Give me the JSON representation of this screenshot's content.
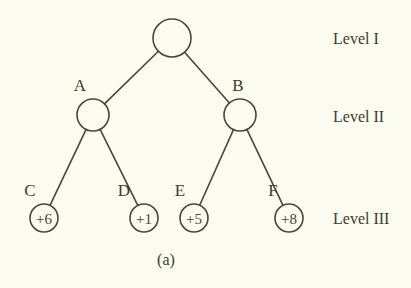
{
  "figure": {
    "caption": "(a)",
    "background_color": "#fcfbef",
    "ink_color": "#4c4639"
  },
  "levels": [
    {
      "id": "level-1",
      "label": "Level I",
      "x": 333,
      "y": 38
    },
    {
      "id": "level-2",
      "label": "Level II",
      "x": 333,
      "y": 116
    },
    {
      "id": "level-3",
      "label": "Level III",
      "x": 333,
      "y": 218
    }
  ],
  "nodes": [
    {
      "id": "root",
      "label": "",
      "value": "",
      "cx": 172,
      "cy": 38,
      "r": 19,
      "label_x": 0,
      "label_y": 0
    },
    {
      "id": "a",
      "label": "A",
      "value": "",
      "cx": 93,
      "cy": 115,
      "r": 16,
      "label_x": 80,
      "label_y": 85
    },
    {
      "id": "b",
      "label": "B",
      "value": "",
      "cx": 240,
      "cy": 115,
      "r": 16,
      "label_x": 238,
      "label_y": 85
    },
    {
      "id": "c",
      "label": "C",
      "value": "+6",
      "cx": 44,
      "cy": 218,
      "r": 14,
      "label_x": 30,
      "label_y": 190
    },
    {
      "id": "d",
      "label": "D",
      "value": "+1",
      "cx": 144,
      "cy": 218,
      "r": 14,
      "label_x": 124,
      "label_y": 190
    },
    {
      "id": "e",
      "label": "E",
      "value": "+5",
      "cx": 194,
      "cy": 218,
      "r": 14,
      "label_x": 180,
      "label_y": 190
    },
    {
      "id": "f",
      "label": "F",
      "value": "+8",
      "cx": 289,
      "cy": 218,
      "r": 14,
      "label_x": 273,
      "label_y": 190
    }
  ],
  "edges": [
    {
      "id": "edge-root-a",
      "from": "root",
      "to": "a"
    },
    {
      "id": "edge-root-b",
      "from": "root",
      "to": "b"
    },
    {
      "id": "edge-a-c",
      "from": "a",
      "to": "c"
    },
    {
      "id": "edge-a-d",
      "from": "a",
      "to": "d"
    },
    {
      "id": "edge-b-e",
      "from": "b",
      "to": "e"
    },
    {
      "id": "edge-b-f",
      "from": "b",
      "to": "f"
    }
  ],
  "caption": {
    "text": "(a)",
    "x": 166,
    "y": 259
  }
}
